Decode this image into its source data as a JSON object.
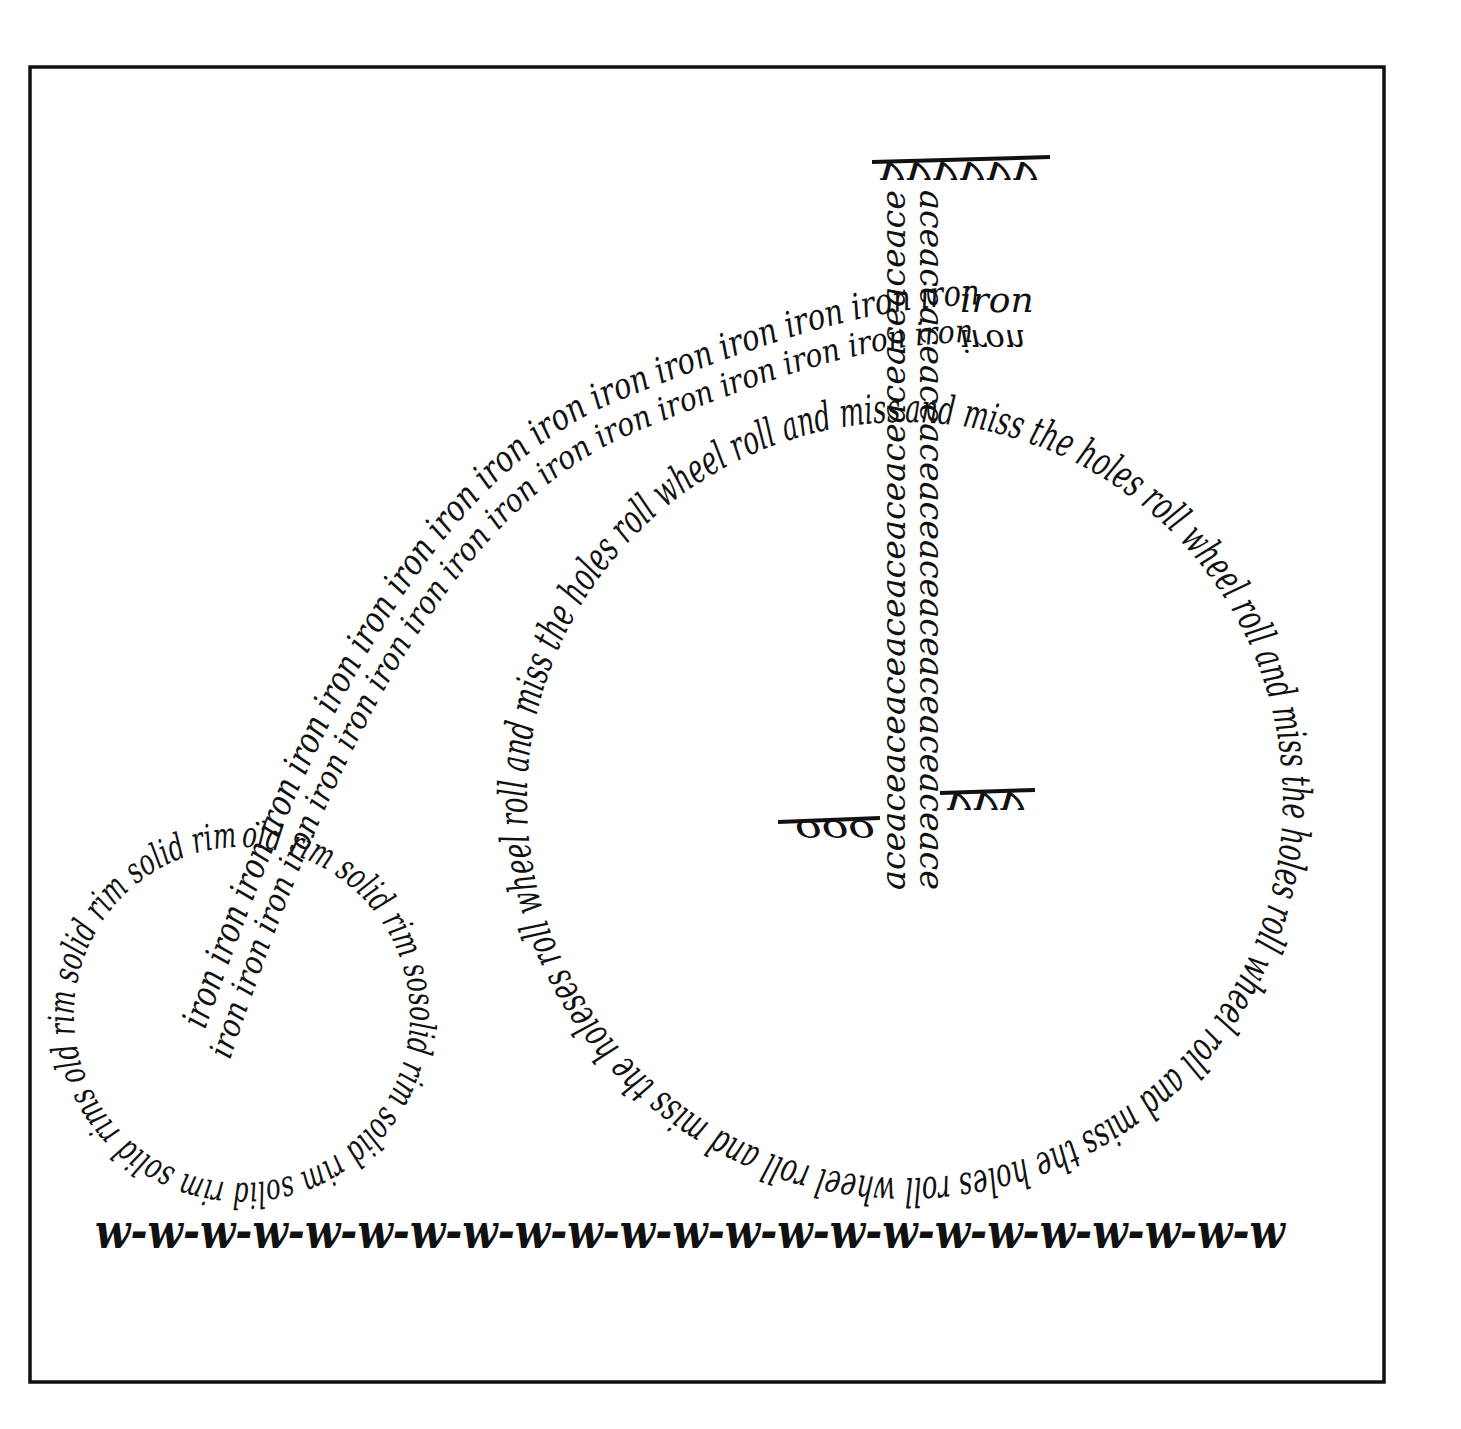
{
  "artwork": {
    "subject": "penny-farthing bicycle calligram",
    "ink_color": "#111111",
    "paper_color": "#ffffff",
    "big_wheel_text": "and miss the holes roll wheel roll and miss the holes roll wheel roll and miss the holes roll wheel roll and miss the holeses roll wheel roll and miss the holes roll wheel roll and miss ",
    "small_wheel_text": "old rim solid rim sosolid rim solid rim solid rim solid rims old rim solid rim solid rim ",
    "frame_upper_text": "iron iron iron iron iron iron iron iron iron iron iron iron iron iron iron iron iron",
    "frame_lower_text": "iron iron iron iron iron iron iron iron iron iron iron iron iron iron iron iron iron",
    "frame_tip_text": "iron",
    "frame_tip_text_flipped": "iron",
    "post_left_text": "aceaceaceaceaceaceaceaceaceaceaceace",
    "post_right_text": "aceaceaceaceaceaceaceaceaceaceaceace",
    "handlebar_text": "vvvvvv",
    "saddle_left_text": "ooo",
    "saddle_right_text": "vvv",
    "ground_text": "w-w-w-w-w-w-w-w-w-w-w-w-w-w-w-w-w-w-w-w-w-w-w"
  }
}
